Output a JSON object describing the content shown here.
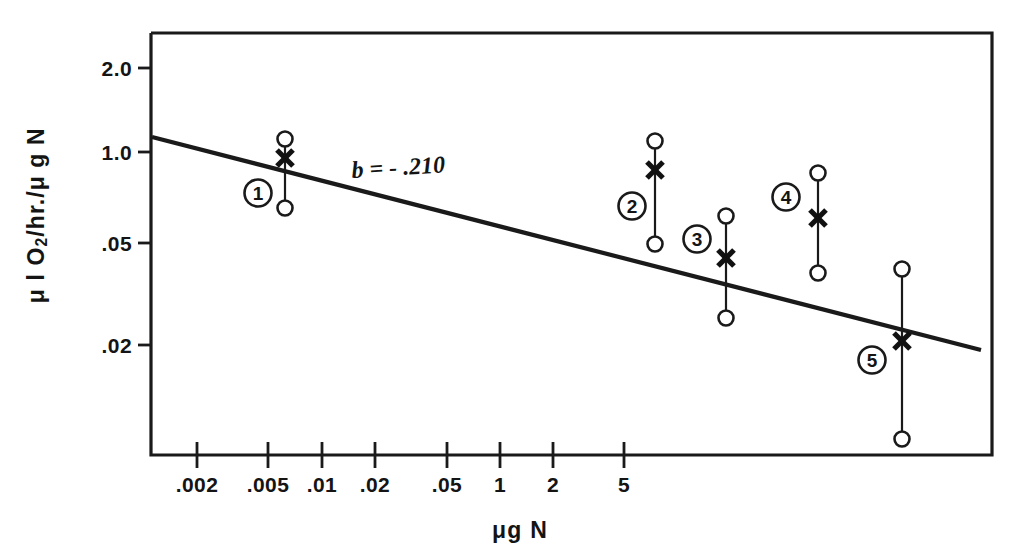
{
  "figure": {
    "kind": "scientific-scatter-figure",
    "background": "#ffffff",
    "ink_color": "#141414"
  },
  "axes": {
    "y_title_html": "&#956; l O<sub>2</sub>/hr./&#956; g N",
    "y_title_text": "μ l O2/hr./μ g N",
    "x_title": "μg N",
    "slope_annotation": "b = - .210"
  },
  "chart_data": {
    "type": "scatter",
    "title": "",
    "xlabel": "μg N",
    "ylabel": "μ l O2/hr./μ g N",
    "xscale": "log",
    "yscale": "log",
    "grid": false,
    "legend": "none",
    "x_tick_labels": [
      ".002",
      ".005",
      ".01",
      ".02",
      ".05",
      "1",
      "2",
      "5"
    ],
    "x_tick_px": [
      197,
      268,
      322,
      375,
      447,
      500,
      553,
      624
    ],
    "y_tick_labels": [
      "2.0",
      "1.0",
      ".05",
      ".02"
    ],
    "y_tick_px": [
      68,
      152,
      243,
      345
    ],
    "series": [
      {
        "name": "group-means-with-range",
        "marker_mean": "x",
        "marker_extremes": "open-circle",
        "points": [
          {
            "group_label": "1",
            "x_tick_label": ".003",
            "mean_label": "1.0",
            "range_low_label": "0.7",
            "range_high_label": "1.2",
            "px": {
              "x": 285,
              "mean_y": 158,
              "top_y": 139,
              "bottom_y": 208,
              "badge_x": 258,
              "badge_y": 193
            }
          },
          {
            "group_label": "2",
            "x_tick_label": ".05",
            "mean_label": "0.9",
            "range_low_label": "0.052",
            "range_high_label": "1.1",
            "px": {
              "x": 655,
              "mean_y": 170,
              "top_y": 141,
              "bottom_y": 244,
              "badge_x": 632,
              "badge_y": 206
            }
          },
          {
            "group_label": "3",
            "x_tick_label": "1",
            "mean_label": "0.045",
            "range_low_label": "0.028",
            "range_high_label": "0.065",
            "px": {
              "x": 726,
              "mean_y": 258,
              "top_y": 216,
              "bottom_y": 318,
              "badge_x": 697,
              "badge_y": 239
            }
          },
          {
            "group_label": "4",
            "x_tick_label": "2",
            "mean_label": "0.062",
            "range_low_label": "0.038",
            "range_high_label": "0.092",
            "px": {
              "x": 818,
              "mean_y": 218,
              "top_y": 173,
              "bottom_y": 273,
              "badge_x": 786,
              "badge_y": 197
            }
          },
          {
            "group_label": "5",
            "x_tick_label": "3.5",
            "mean_label": "0.024",
            "range_low_label": "0.009",
            "range_high_label": "0.042",
            "px": {
              "x": 902,
              "mean_y": 341,
              "top_y": 269,
              "bottom_y": 439,
              "badge_x": 872,
              "badge_y": 360
            }
          }
        ]
      },
      {
        "name": "regression-line",
        "type": "line",
        "slope_b": -0.21,
        "annotation": "b = - .210",
        "px": {
          "x1": 152,
          "y1": 137,
          "x2": 981,
          "y2": 350
        }
      }
    ]
  },
  "layout": {
    "frame_px": {
      "left": 151,
      "top": 33,
      "right": 992,
      "bottom": 455
    },
    "annotation_px": {
      "x": 352,
      "y": 178
    }
  }
}
